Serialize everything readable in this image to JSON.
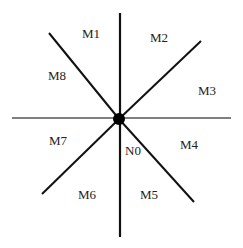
{
  "diagram": {
    "type": "radial-neighborhood",
    "center_label": "N0",
    "directions": [
      {
        "id": "M1",
        "label": "M1",
        "x": 82,
        "y": 27
      },
      {
        "id": "M2",
        "label": "M2",
        "x": 150,
        "y": 31
      },
      {
        "id": "M3",
        "label": "M3",
        "x": 198,
        "y": 84
      },
      {
        "id": "M4",
        "label": "M4",
        "x": 180,
        "y": 138
      },
      {
        "id": "M5",
        "label": "M5",
        "x": 140,
        "y": 188
      },
      {
        "id": "M6",
        "label": "M6",
        "x": 78,
        "y": 188
      },
      {
        "id": "M7",
        "label": "M7",
        "x": 49,
        "y": 134
      },
      {
        "id": "M8",
        "label": "M8",
        "x": 48,
        "y": 69
      }
    ],
    "center": {
      "label": "N0",
      "x": 125,
      "y": 144,
      "dot_x": 119,
      "dot_y": 119,
      "dot_r": 6
    },
    "lines": [
      {
        "name": "vertical-line",
        "x1": 120,
        "y1": 13,
        "x2": 120,
        "y2": 237
      },
      {
        "name": "horizontal-line",
        "x1": 12,
        "y1": 118,
        "x2": 231,
        "y2": 118
      },
      {
        "name": "diagonal-nw-se-upper",
        "x1": 49,
        "y1": 33,
        "x2": 119,
        "y2": 119
      },
      {
        "name": "diagonal-nw-se-lower",
        "x1": 119,
        "y1": 119,
        "x2": 194,
        "y2": 202
      },
      {
        "name": "diagonal-sw-ne-upper",
        "x1": 119,
        "y1": 119,
        "x2": 201,
        "y2": 41
      },
      {
        "name": "diagonal-sw-ne-lower",
        "x1": 42,
        "y1": 194,
        "x2": 119,
        "y2": 119
      }
    ],
    "colors": {
      "line": "#111111",
      "horizontal_line": "#555555",
      "dot": "#000000",
      "text": "#222222"
    }
  }
}
